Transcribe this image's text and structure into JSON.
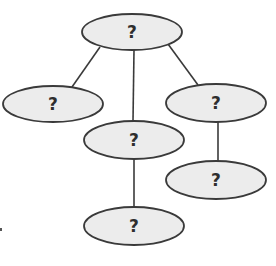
{
  "diagram": {
    "type": "tree",
    "colors": {
      "node_fill": "#ececec",
      "stroke": "#3a3a3a",
      "text": "#2e2e2e",
      "background": "#ffffff"
    },
    "nodes": [
      {
        "id": "root",
        "label": "?",
        "cx": 132,
        "cy": 32,
        "rx": 50,
        "ry": 18
      },
      {
        "id": "left",
        "label": "?",
        "cx": 53,
        "cy": 104,
        "rx": 50,
        "ry": 18
      },
      {
        "id": "middle",
        "label": "?",
        "cx": 134,
        "cy": 140,
        "rx": 50,
        "ry": 19
      },
      {
        "id": "right",
        "label": "?",
        "cx": 216,
        "cy": 103,
        "rx": 50,
        "ry": 19
      },
      {
        "id": "right-child",
        "label": "?",
        "cx": 216,
        "cy": 180,
        "rx": 50,
        "ry": 19
      },
      {
        "id": "bottom",
        "label": "?",
        "cx": 134,
        "cy": 226,
        "rx": 50,
        "ry": 19
      }
    ],
    "edges": [
      {
        "from": "root",
        "to": "left"
      },
      {
        "from": "root",
        "to": "middle"
      },
      {
        "from": "root",
        "to": "right"
      },
      {
        "from": "middle",
        "to": "bottom"
      },
      {
        "from": "right",
        "to": "right-child"
      }
    ],
    "stray_mark": {
      "x": 1,
      "y": 229
    }
  }
}
